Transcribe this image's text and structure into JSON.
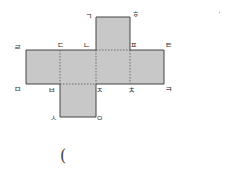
{
  "diagram": {
    "type": "cube-net",
    "fill_color": "#c8c8c8",
    "edge_color": "#444444",
    "vertex_labels": {
      "top_left": "ㄱ",
      "top_right": "ㅎ",
      "row_top_left": "ㄹ",
      "row_top_2": "ㄷ",
      "row_top_3": "ㄴ",
      "row_top_4": "ㅍ",
      "row_top_right": "ㅌ",
      "row_bottom_left": "ㅁ",
      "row_bottom_2": "ㅂ",
      "row_bottom_3": "ㅈ",
      "row_bottom_4": "ㅊ",
      "row_bottom_right": "ㅋ",
      "bottom_left": "ㅅ",
      "bottom_right": "ㅇ"
    }
  },
  "answer": {
    "paren": "("
  }
}
